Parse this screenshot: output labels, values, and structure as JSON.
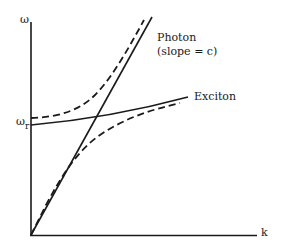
{
  "diagram": {
    "type": "dispersion-relation",
    "axes": {
      "y_label": "ω",
      "x_label": "k",
      "y_marker_symbol": "ω",
      "y_marker_sub": "r"
    },
    "labels": {
      "photon": "Photon",
      "photon_slope": "(slope = c)",
      "exciton": "Exciton"
    },
    "curves": [
      {
        "name": "photon",
        "style": "solid",
        "description": "straight line from origin, slope = c"
      },
      {
        "name": "exciton",
        "style": "solid",
        "description": "nearly flat line starting at ω_r, slowly rising"
      },
      {
        "name": "upper-polariton",
        "style": "dashed",
        "description": "starts above ω_r, bends up to asymptote photon line"
      },
      {
        "name": "lower-polariton",
        "style": "dashed",
        "description": "starts at origin along photon line, bends over to approach exciton line"
      }
    ],
    "colors": {
      "line": "#1a1a1a",
      "background": "#ffffff"
    }
  }
}
